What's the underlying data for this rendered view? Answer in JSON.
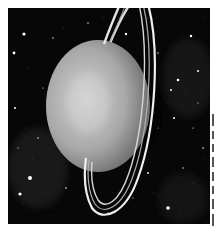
{
  "image": {
    "subject": "ringed-planet",
    "description": "Grayscale illustration of a ringed planet (Uranus-like) against a dense starfield",
    "colors": {
      "background": "#070707",
      "planet_light": "#c8c8c8",
      "planet_mid": "#9a9a9a",
      "planet_dark": "#4a4a4a",
      "ring": "#e8e8e8",
      "page": "#ffffff"
    }
  },
  "edge_text": {
    "note": "cropped text glyphs along right edge"
  }
}
